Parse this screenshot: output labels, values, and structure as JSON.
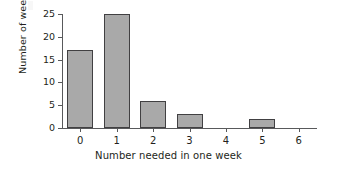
{
  "chart_data": {
    "type": "bar",
    "title": "",
    "xlabel": "Number needed in one week",
    "ylabel": "Number of weeks",
    "categories": [
      "0",
      "1",
      "2",
      "3",
      "4",
      "5",
      "6"
    ],
    "values": [
      17,
      25,
      6,
      3,
      0,
      2,
      0
    ],
    "series": [
      {
        "name": "Number of weeks",
        "values": [
          17,
          25,
          6,
          3,
          0,
          2,
          0
        ]
      }
    ],
    "xlim": [
      -0.5,
      6.5
    ],
    "ylim": [
      0,
      25
    ],
    "ytick_labels": [
      "0",
      "5",
      "10",
      "15",
      "20",
      "25"
    ],
    "ytick_values": [
      0,
      5,
      10,
      15,
      20,
      25
    ],
    "xtick_labels": [
      "0",
      "1",
      "2",
      "3",
      "4",
      "5",
      "6"
    ],
    "grid": false,
    "legend": false,
    "legend_position": "none",
    "bar_fill_color": "#a9a9a9",
    "bar_edge_color": "#414042",
    "axis_color": "#58595b",
    "text_color": "#231f20",
    "background_color": "#ffffff"
  }
}
